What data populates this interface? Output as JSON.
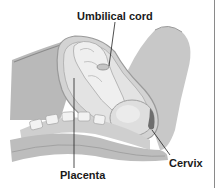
{
  "diagram": {
    "type": "anatomical-illustration",
    "colors": {
      "background": "#ffffff",
      "tissue_dark": "#9a9a9a",
      "tissue_mid": "#bdbdbd",
      "tissue_light": "#e2e2e2",
      "line": "#222222",
      "border": "#8a8a8a"
    },
    "labels": [
      {
        "id": "umbilical-cord",
        "text": "Umbilical cord"
      },
      {
        "id": "placenta",
        "text": "Placenta"
      },
      {
        "id": "cervix",
        "text": "Cervix"
      }
    ]
  }
}
